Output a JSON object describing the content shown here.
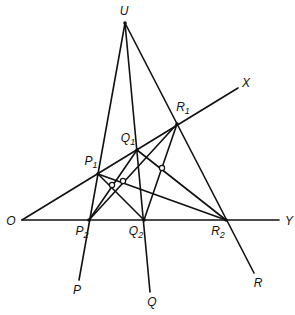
{
  "diagram": {
    "type": "projective-geometry-construction",
    "stroke_color": "#111111",
    "background": "#ffffff",
    "points": {
      "U": {
        "label": "U",
        "sub": "",
        "x": 125,
        "y": 23,
        "lx": 124,
        "ly": 11
      },
      "O": {
        "label": "O",
        "sub": "",
        "x": 22,
        "y": 220,
        "lx": 11,
        "ly": 221
      },
      "P1": {
        "label": "P",
        "sub": "1",
        "x": 98,
        "y": 174,
        "lx": 91,
        "ly": 163
      },
      "Q1": {
        "label": "Q",
        "sub": "1",
        "x": 137,
        "y": 150,
        "lx": 128,
        "ly": 140
      },
      "R1": {
        "label": "R",
        "sub": "1",
        "x": 177,
        "y": 124,
        "lx": 183,
        "ly": 109
      },
      "P2": {
        "label": "P",
        "sub": "2",
        "x": 89,
        "y": 220,
        "lx": 82,
        "ly": 233
      },
      "Q2": {
        "label": "Q",
        "sub": "2",
        "x": 144,
        "y": 220,
        "lx": 136,
        "ly": 233
      },
      "R2": {
        "label": "R",
        "sub": "2",
        "x": 226,
        "y": 220,
        "lx": 218,
        "ly": 233
      },
      "X": {
        "label": "X",
        "sub": "",
        "x": 238,
        "y": 88,
        "lx": 246,
        "ly": 83
      },
      "Y": {
        "label": "Y",
        "sub": "",
        "x": 279,
        "y": 220,
        "lx": 289,
        "ly": 221
      },
      "P": {
        "label": "P",
        "sub": "",
        "x": 79,
        "y": 280,
        "lx": 77,
        "ly": 290
      },
      "Q": {
        "label": "Q",
        "sub": "",
        "x": 150,
        "y": 292,
        "lx": 152,
        "ly": 302
      },
      "R": {
        "label": "R",
        "sub": "",
        "x": 254,
        "y": 273,
        "lx": 258,
        "ly": 283
      }
    },
    "lines": [
      [
        "O",
        "X"
      ],
      [
        "O",
        "Y"
      ],
      [
        "U",
        "P"
      ],
      [
        "U",
        "Q"
      ],
      [
        "U",
        "R"
      ],
      [
        "P1",
        "Q2"
      ],
      [
        "Q1",
        "P2"
      ],
      [
        "P1",
        "R2"
      ],
      [
        "R1",
        "P2"
      ],
      [
        "Q1",
        "R2"
      ],
      [
        "R1",
        "Q2"
      ]
    ],
    "intersection_markers": [
      {
        "x": 112,
        "y": 185
      },
      {
        "x": 123,
        "y": 181
      },
      {
        "x": 162,
        "y": 168
      }
    ]
  }
}
